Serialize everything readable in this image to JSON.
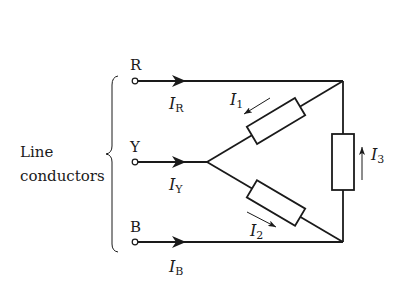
{
  "diagram": {
    "type": "three-phase star-connected load",
    "group_label": {
      "line1": "Line",
      "line2": "conductors"
    },
    "terminals": [
      {
        "id": "R",
        "label": "R",
        "current": "I",
        "current_sub": "R"
      },
      {
        "id": "Y",
        "label": "Y",
        "current": "I",
        "current_sub": "Y"
      },
      {
        "id": "B",
        "label": "B",
        "current": "I",
        "current_sub": "B"
      }
    ],
    "branch_currents": [
      {
        "id": "I1",
        "symbol": "I",
        "sub": "1",
        "direction": "toward star point"
      },
      {
        "id": "I2",
        "symbol": "I",
        "sub": "2",
        "direction": "away from star point"
      },
      {
        "id": "I3",
        "symbol": "I",
        "sub": "3",
        "direction": "upward"
      }
    ],
    "colors": {
      "line": "#1a1a1a",
      "background": "#ffffff"
    }
  }
}
